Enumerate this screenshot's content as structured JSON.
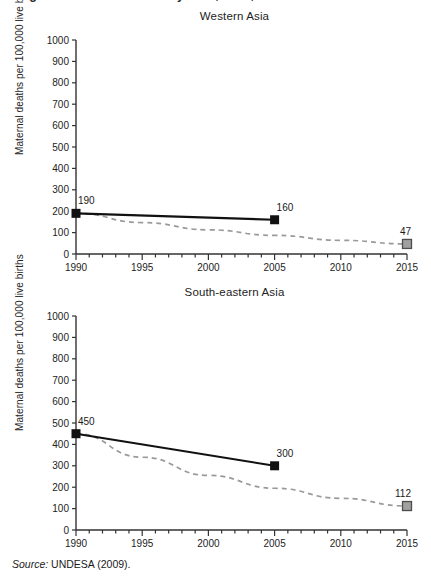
{
  "figure": {
    "cut_title": "Figure 3.  Maternal mortality ratio, 1990, 2005 and 2015 target",
    "source_prefix": "Source:",
    "source_text": "UNDESA (2009)."
  },
  "axis": {
    "y_label": "Maternal deaths per 100,000 live births",
    "y_ticks": [
      "1000",
      "900",
      "800",
      "700",
      "600",
      "500",
      "400",
      "300",
      "200",
      "100",
      "0"
    ],
    "x_ticks": [
      "1990",
      "1995",
      "2000",
      "2005",
      "2010",
      "2015"
    ],
    "y_min": 0,
    "y_max": 1000,
    "x_min": 1990,
    "x_max": 2015
  },
  "colors": {
    "observed_line": "#111111",
    "observed_marker": "#111111",
    "target_line": "#9a9a9a",
    "target_marker": "#a0a0a0",
    "target_marker_border": "#4d4d4d",
    "axis": "#333333",
    "text": "#232323"
  },
  "chart_data": [
    {
      "type": "line",
      "title": "Western Asia",
      "xlabel": "",
      "ylabel": "Maternal deaths per 100,000 live births",
      "xlim": [
        1990,
        2015
      ],
      "ylim": [
        0,
        1000
      ],
      "grid": false,
      "legend": "none",
      "x": [
        1990,
        2005,
        2015
      ],
      "series": [
        {
          "name": "Observed maternal mortality ratio",
          "style": "solid",
          "marker": "filled-square",
          "x": [
            1990,
            2005
          ],
          "values": [
            190,
            160
          ],
          "labels": [
            "190",
            "160"
          ]
        },
        {
          "name": "MDG target trajectory",
          "style": "dashed",
          "marker": "grey-square",
          "x": [
            1990,
            1995,
            2000,
            2005,
            2010,
            2015
          ],
          "values": [
            190,
            147,
            113,
            87,
            64,
            47
          ],
          "labels": [
            "",
            "",
            "",
            "",
            "",
            "47"
          ]
        }
      ],
      "annotations": [
        {
          "text": "190",
          "x": 1990,
          "y": 190
        },
        {
          "text": "160",
          "x": 2005,
          "y": 160
        },
        {
          "text": "47",
          "x": 2015,
          "y": 47
        }
      ]
    },
    {
      "type": "line",
      "title": "South-eastern Asia",
      "xlabel": "",
      "ylabel": "Maternal deaths per 100,000 live births",
      "xlim": [
        1990,
        2015
      ],
      "ylim": [
        0,
        1000
      ],
      "grid": false,
      "legend": "none",
      "x": [
        1990,
        2005,
        2015
      ],
      "series": [
        {
          "name": "Observed maternal mortality ratio",
          "style": "solid",
          "marker": "filled-square",
          "x": [
            1990,
            2005
          ],
          "values": [
            450,
            300
          ],
          "labels": [
            "450",
            "300"
          ]
        },
        {
          "name": "MDG target trajectory",
          "style": "dashed",
          "marker": "grey-square",
          "x": [
            1990,
            1995,
            2000,
            2005,
            2010,
            2015
          ],
          "values": [
            450,
            340,
            255,
            195,
            148,
            112
          ],
          "labels": [
            "",
            "",
            "",
            "",
            "",
            "112"
          ]
        }
      ],
      "annotations": [
        {
          "text": "450",
          "x": 1990,
          "y": 450
        },
        {
          "text": "300",
          "x": 2005,
          "y": 300
        },
        {
          "text": "112",
          "x": 2015,
          "y": 112
        }
      ]
    }
  ]
}
